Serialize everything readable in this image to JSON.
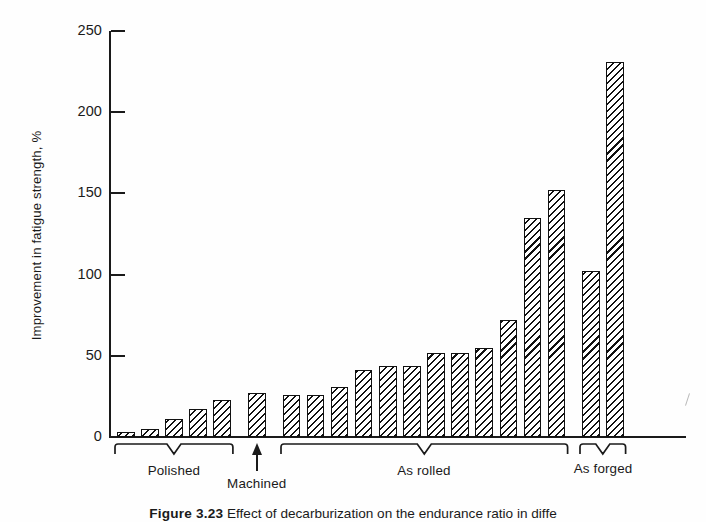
{
  "figure": {
    "caption_label": "Figure 3.23",
    "caption_text": "Effect of decarburization on the endurance ratio in diffe"
  },
  "chart_data": {
    "type": "bar",
    "title": "",
    "xlabel": "",
    "ylabel": "Improvement in fatigue strength, %",
    "ylim": [
      0,
      250
    ],
    "yticks": [
      0,
      50,
      100,
      150,
      200,
      250
    ],
    "ytick_labels": [
      "0",
      "50",
      "100",
      "150",
      "200",
      "250"
    ],
    "grid": false,
    "legend": "none",
    "bar_style": "diagonal-hatch",
    "categories": [
      "P1",
      "P2",
      "P3",
      "P4",
      "P5",
      "M1",
      "R1",
      "R2",
      "R3",
      "R4",
      "R5",
      "R6",
      "R7",
      "R8",
      "R9",
      "R10",
      "R11",
      "R12",
      "F1",
      "F2"
    ],
    "values": [
      3,
      5,
      11,
      17,
      23,
      27,
      26,
      26,
      31,
      41,
      44,
      44,
      52,
      52,
      55,
      72,
      135,
      152,
      102,
      231
    ],
    "groups": [
      {
        "name": "Polished",
        "label": "Polished",
        "start": 0,
        "count": 5,
        "marker": "bracket"
      },
      {
        "name": "Machined",
        "label": "Machined",
        "start": 5,
        "count": 1,
        "marker": "arrow"
      },
      {
        "name": "As rolled",
        "label": "As rolled",
        "start": 6,
        "count": 12,
        "marker": "bracket"
      },
      {
        "name": "As forged",
        "label": "As forged",
        "start": 18,
        "count": 2,
        "marker": "bracket"
      }
    ],
    "colors": {
      "axis": "#1a1a1a",
      "bar_outline": "#111111",
      "bar_fill": "#ffffff",
      "hatch": "#111111",
      "background": "#fefefe"
    }
  }
}
